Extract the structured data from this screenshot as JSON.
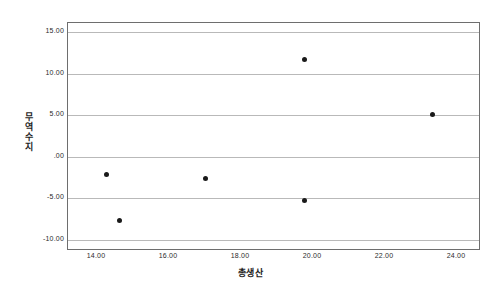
{
  "chart_data": {
    "type": "scatter",
    "title": "",
    "xlabel": "총생산",
    "ylabel": "무역수지",
    "xlim": [
      13.2,
      24.6
    ],
    "ylim": [
      -11.1,
      16.1
    ],
    "grid": true,
    "legend": "none",
    "xticks": [
      "14.00",
      "16.00",
      "18.00",
      "20.00",
      "22.00",
      "24.00"
    ],
    "xtick_values": [
      14.0,
      16.0,
      18.0,
      20.0,
      22.0,
      24.0
    ],
    "yticks": [
      "15.00",
      "10.00",
      "5.00",
      ".00",
      "-5.00",
      "-10.00"
    ],
    "ytick_values": [
      15.0,
      10.0,
      5.0,
      0.0,
      -5.0,
      -10.0
    ],
    "marker": "filled-circle",
    "marker_color": "#1a1a1a",
    "gridline_color": "#b9b9b9",
    "frame_color": "#6e6e6e",
    "points": [
      {
        "x": 14.28,
        "y": -2.1
      },
      {
        "x": 14.62,
        "y": -7.7
      },
      {
        "x": 17.0,
        "y": -2.6
      },
      {
        "x": 19.75,
        "y": 11.7
      },
      {
        "x": 19.77,
        "y": -5.3
      },
      {
        "x": 23.3,
        "y": 5.1
      }
    ]
  }
}
